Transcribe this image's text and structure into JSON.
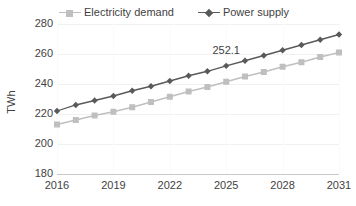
{
  "chart_data": {
    "type": "line",
    "title": "",
    "xlabel": "",
    "ylabel": "TWh",
    "ylim": [
      180,
      280
    ],
    "yticks": [
      180,
      200,
      220,
      240,
      260,
      280
    ],
    "xticks": [
      "2016",
      "2019",
      "2022",
      "2025",
      "2028",
      "2031"
    ],
    "grid": "faint",
    "legend_position": "top-center",
    "x": [
      2016,
      2017,
      2018,
      2019,
      2020,
      2021,
      2022,
      2023,
      2024,
      2025,
      2026,
      2027,
      2028,
      2029,
      2030,
      2031
    ],
    "series": [
      {
        "name": "Electricity demand",
        "marker": "square",
        "color": "#bfbfbf",
        "values": [
          213.0,
          216.0,
          219.0,
          221.5,
          224.5,
          228.0,
          231.5,
          235.0,
          238.0,
          241.5,
          245.0,
          248.0,
          251.5,
          254.5,
          258.0,
          261.0
        ]
      },
      {
        "name": "Power supply",
        "marker": "diamond",
        "color": "#595959",
        "values": [
          222.0,
          226.0,
          229.0,
          232.0,
          235.5,
          238.5,
          242.0,
          245.5,
          248.5,
          252.1,
          255.5,
          259.0,
          262.5,
          266.0,
          269.5,
          273.0
        ]
      }
    ],
    "annotations": [
      {
        "text": "252.1",
        "x": 2025,
        "y": 252.1,
        "series": "Power supply"
      }
    ]
  },
  "legend": {
    "items": [
      {
        "label": "Electricity demand",
        "marker": "square",
        "color": "#bfbfbf"
      },
      {
        "label": "Power supply",
        "marker": "diamond",
        "color": "#595959"
      }
    ]
  },
  "axes": {
    "y_label": "TWh",
    "y_ticks": [
      "280",
      "260",
      "240",
      "220",
      "200",
      "180"
    ],
    "x_ticks": [
      "2016",
      "2019",
      "2022",
      "2025",
      "2028",
      "2031"
    ]
  }
}
